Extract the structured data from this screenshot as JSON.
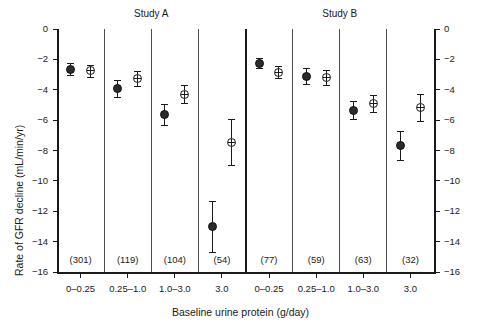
{
  "chart_data": {
    "type": "scatter",
    "title": "",
    "xlabel": "Baseline urine protein (g/day)",
    "ylabel": "Rate of GFR decline (mL/min/yr)",
    "ylim": [
      -16,
      0
    ],
    "yticks": [
      0,
      -2,
      -4,
      -6,
      -8,
      -10,
      -12,
      -14,
      -16
    ],
    "ytick_labels": [
      "0",
      "−2",
      "−4",
      "−6",
      "−8",
      "−10",
      "−12",
      "−14",
      "−16"
    ],
    "right_axis_mirrors_left": true,
    "grid": false,
    "legend_position": "none",
    "panels": [
      {
        "label": "Study A",
        "groups": [
          0,
          1,
          2,
          3
        ]
      },
      {
        "label": "Study B",
        "groups": [
          4,
          5,
          6,
          7
        ]
      }
    ],
    "categories": [
      "0–0.25",
      "0.25–1.0",
      "1.0–3.0",
      "3.0",
      "0–0.25",
      "0.25–1.0",
      "1.0–3.0",
      "3.0"
    ],
    "group_counts": [
      "(301)",
      "(119)",
      "(104)",
      "(54)",
      "(77)",
      "(59)",
      "(63)",
      "(32)"
    ],
    "marker_styles": [
      "filled",
      "open"
    ],
    "points": [
      {
        "group": 0,
        "panel": "Study A",
        "category": "0–0.25",
        "style": "filled",
        "value": -2.65,
        "low": -3.05,
        "high": -2.25
      },
      {
        "group": 0,
        "panel": "Study A",
        "category": "0–0.25",
        "style": "open",
        "value": -2.75,
        "low": -3.15,
        "high": -2.35
      },
      {
        "group": 1,
        "panel": "Study A",
        "category": "0.25–1.0",
        "style": "filled",
        "value": -3.9,
        "low": -4.45,
        "high": -3.35
      },
      {
        "group": 1,
        "panel": "Study A",
        "category": "0.25–1.0",
        "style": "open",
        "value": -3.25,
        "low": -3.75,
        "high": -2.75
      },
      {
        "group": 2,
        "panel": "Study A",
        "category": "1.0–3.0",
        "style": "filled",
        "value": -5.65,
        "low": -6.35,
        "high": -4.95
      },
      {
        "group": 2,
        "panel": "Study A",
        "category": "1.0–3.0",
        "style": "open",
        "value": -4.3,
        "low": -4.9,
        "high": -3.7
      },
      {
        "group": 3,
        "panel": "Study A",
        "category": "3.0",
        "style": "filled",
        "value": -13.0,
        "low": -14.7,
        "high": -11.35
      },
      {
        "group": 3,
        "panel": "Study A",
        "category": "3.0",
        "style": "open",
        "value": -7.45,
        "low": -8.95,
        "high": -5.95
      },
      {
        "group": 4,
        "panel": "Study B",
        "category": "0–0.25",
        "style": "filled",
        "value": -2.25,
        "low": -2.6,
        "high": -1.9
      },
      {
        "group": 4,
        "panel": "Study B",
        "category": "0–0.25",
        "style": "open",
        "value": -2.85,
        "low": -3.25,
        "high": -2.45
      },
      {
        "group": 5,
        "panel": "Study B",
        "category": "0.25–1.0",
        "style": "filled",
        "value": -3.1,
        "low": -3.65,
        "high": -2.6
      },
      {
        "group": 5,
        "panel": "Study B",
        "category": "0.25–1.0",
        "style": "open",
        "value": -3.2,
        "low": -3.7,
        "high": -2.7
      },
      {
        "group": 6,
        "panel": "Study B",
        "category": "1.0–3.0",
        "style": "filled",
        "value": -5.35,
        "low": -5.95,
        "high": -4.75
      },
      {
        "group": 6,
        "panel": "Study B",
        "category": "1.0–3.0",
        "style": "open",
        "value": -4.9,
        "low": -5.45,
        "high": -4.35
      },
      {
        "group": 7,
        "panel": "Study B",
        "category": "3.0",
        "style": "filled",
        "value": -7.65,
        "low": -8.6,
        "high": -6.7
      },
      {
        "group": 7,
        "panel": "Study B",
        "category": "3.0",
        "style": "open",
        "value": -5.15,
        "low": -6.05,
        "high": -4.25
      }
    ],
    "colors": {
      "axis": "#1a1a1a",
      "separator": "#4d4d4d",
      "panel_divider": "#1a1a1a",
      "marker_filled": "#2b2b2b",
      "marker_open_fill": "#ffffff",
      "marker_open_edge": "#1a1a1a",
      "background": "#ffffff"
    }
  }
}
